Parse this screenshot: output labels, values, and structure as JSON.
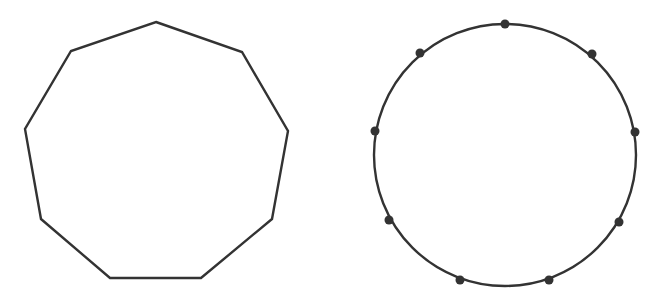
{
  "diagram": {
    "stroke_color": "#333333",
    "background": "#ffffff",
    "nonagon": {
      "sides": 9,
      "stroke_width": 2.4,
      "vertices": [
        [
          156,
          22
        ],
        [
          242,
          52
        ],
        [
          288,
          131
        ],
        [
          272,
          219
        ],
        [
          201,
          278
        ],
        [
          110,
          278
        ],
        [
          41,
          219
        ],
        [
          25,
          129
        ],
        [
          71,
          51
        ]
      ]
    },
    "circle": {
      "center": [
        505,
        155
      ],
      "radius": 131,
      "stroke_width": 2.4,
      "point_count": 9,
      "point_radius": 4.5,
      "points": [
        [
          505,
          24
        ],
        [
          592,
          54
        ],
        [
          635,
          132
        ],
        [
          619,
          222
        ],
        [
          549,
          280
        ],
        [
          460,
          280
        ],
        [
          389,
          220
        ],
        [
          375,
          131
        ],
        [
          420,
          53
        ]
      ]
    }
  }
}
